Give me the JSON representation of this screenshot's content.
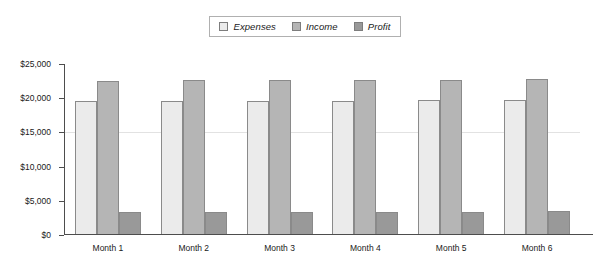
{
  "chart_data": {
    "type": "bar",
    "title": "",
    "subtitle": "",
    "xlabel": "",
    "ylabel": "",
    "categories": [
      "Month 1",
      "Month 2",
      "Month 3",
      "Month 4",
      "Month 5",
      "Month 6"
    ],
    "series": [
      {
        "name": "Expenses",
        "color": "#ebebeb",
        "values": [
          19400,
          19400,
          19450,
          19500,
          19550,
          19600
        ]
      },
      {
        "name": "Income",
        "color": "#b5b5b5",
        "values": [
          22400,
          22450,
          22500,
          22500,
          22550,
          22600
        ]
      },
      {
        "name": "Profit",
        "color": "#999999",
        "values": [
          3150,
          3150,
          3200,
          3250,
          3250,
          3300
        ]
      }
    ],
    "ylim": [
      0,
      25000
    ],
    "y_ticks": [
      0,
      5000,
      10000,
      15000,
      20000,
      25000
    ],
    "y_tick_labels": [
      "$0",
      "$5,000",
      "$10,000",
      "$15,000",
      "$20,000",
      "$25,000"
    ],
    "gridlines_at": [
      15000
    ],
    "grid": "single-faint-horizontal",
    "legend_position": "top-center",
    "legend_italic": true
  },
  "colors": {
    "background": "#ffffff",
    "axis": "#4d4d4d",
    "bar_border": "#8a8a8a",
    "gridline": "#e2e2e2",
    "legend_border": "#b0b0b0",
    "text": "#1a1a1a"
  }
}
